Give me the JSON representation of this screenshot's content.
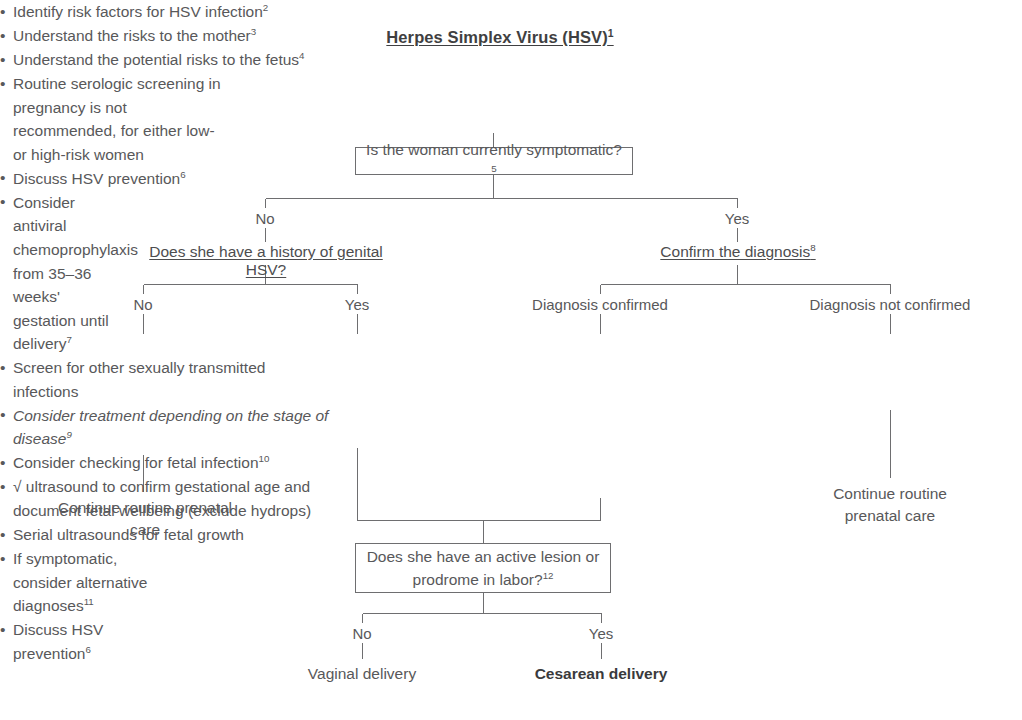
{
  "title": "Herpes Simplex Virus (HSV)",
  "title_note": "1",
  "title_bullets": [
    {
      "text": "Identify risk factors for HSV infection",
      "note": "2"
    },
    {
      "text": "Understand the risks to the mother",
      "note": "3"
    },
    {
      "text": "Understand the potential risks to the fetus",
      "note": "4"
    }
  ],
  "decision_symptomatic": {
    "text": "Is the woman currently symptomatic?",
    "note": "5"
  },
  "level1": {
    "no_label": "No",
    "yes_label": "Yes",
    "no_heading": "Does she have a history of genital HSV?",
    "no_heading_note": "",
    "yes_heading": "Confirm the diagnosis",
    "yes_heading_note": "8"
  },
  "level2_left": {
    "no_label": "No",
    "yes_label": "Yes"
  },
  "level2_right": {
    "confirmed_label": "Diagnosis confirmed",
    "not_confirmed_label": "Diagnosis not confirmed"
  },
  "column_a": {
    "bullets": [
      {
        "text": "Routine serologic screening in pregnancy is not recommended, for either low- or high-risk women",
        "note": "",
        "italic": false
      },
      {
        "text": "Discuss HSV prevention",
        "note": "6",
        "italic": false
      }
    ],
    "outcome": "Continue routine prenatal care"
  },
  "column_b": {
    "bullets": [
      {
        "text": "Consider antiviral chemoprophylaxis from 35–36 weeks' gestation until delivery",
        "note": "7",
        "italic": false
      }
    ]
  },
  "column_c": {
    "bullets": [
      {
        "text": "Screen for other sexually transmitted infections",
        "note": "",
        "italic": false
      },
      {
        "text": "Consider treatment depending on the stage of disease",
        "note": "9",
        "italic": true
      },
      {
        "text": "Consider checking for fetal infection",
        "note": "10",
        "italic": false
      },
      {
        "text": "√ ultrasound to confirm gestational age and document fetal wellbeing (exclude hydrops)",
        "note": "",
        "italic": false
      },
      {
        "text": "Serial ultrasounds for fetal growth",
        "note": "",
        "italic": false
      }
    ]
  },
  "column_d": {
    "bullets": [
      {
        "text": "If symptomatic, consider alternative diagnoses",
        "note": "11",
        "italic": false
      },
      {
        "text": "Discuss HSV prevention",
        "note": "6",
        "italic": false
      }
    ],
    "outcome": "Continue routine prenatal care"
  },
  "decision_lesion": {
    "text": "Does she have an active lesion or prodrome in labor?",
    "note": "12"
  },
  "level3": {
    "no_label": "No",
    "yes_label": "Yes",
    "no_outcome": "Vaginal delivery",
    "yes_outcome": "Cesarean delivery"
  },
  "bullet_glyph": "•",
  "colors": {
    "text": "#58585a",
    "heading": "#3f3f41",
    "line": "#6e6e70",
    "background": "#ffffff"
  }
}
